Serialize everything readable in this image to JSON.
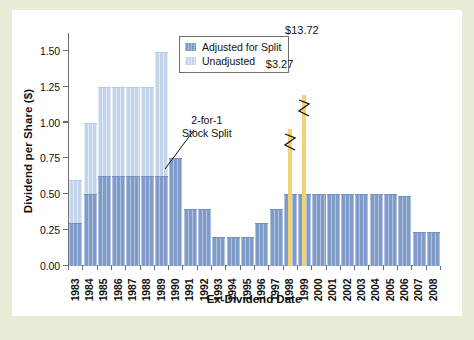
{
  "figure": {
    "background_color": "#e6ecd5",
    "card_color": "#ffffff"
  },
  "chart_data": {
    "type": "bar",
    "title": "",
    "xlabel": "Ex-Dividend Date",
    "ylabel": "Dividend per Share ($)",
    "ylim": [
      0.0,
      1.625
    ],
    "ytick_labels": [
      "0.00",
      "0.25",
      "0.50",
      "0.75",
      "1.00",
      "1.25",
      "1.50"
    ],
    "ytick_values": [
      0.0,
      0.25,
      0.5,
      0.75,
      1.0,
      1.25,
      1.5
    ],
    "grid": false,
    "legend_position": "upper center",
    "categories": [
      "1983",
      "1984",
      "1985",
      "1986",
      "1987",
      "1988",
      "1989",
      "1990",
      "1991",
      "1992",
      "1993",
      "1994",
      "1995",
      "1996",
      "1997",
      "1998",
      "1999",
      "2000",
      "2001",
      "2002",
      "2003",
      "2004",
      "2005",
      "2006",
      "2007",
      "2008"
    ],
    "series": [
      {
        "name": "Unadjusted",
        "color": "#c3d5ea",
        "values": [
          0.6,
          1.0,
          1.25,
          1.25,
          1.25,
          1.25,
          1.49,
          null,
          null,
          null,
          null,
          null,
          null,
          null,
          null,
          null,
          null,
          null,
          null,
          null,
          null,
          null,
          null,
          null,
          null,
          null
        ]
      },
      {
        "name": "Adjusted for Split",
        "color": "#7e9bc9",
        "values": [
          0.3,
          0.5,
          0.625,
          0.625,
          0.625,
          0.625,
          0.625,
          0.75,
          0.4,
          0.4,
          0.2,
          0.2,
          0.2,
          0.3,
          0.4,
          0.5,
          0.5,
          0.5,
          0.5,
          0.5,
          0.5,
          0.5,
          0.5,
          0.49,
          0.235,
          0.235
        ]
      }
    ],
    "special_dividends": [
      {
        "label": "$3.27",
        "year": "1998",
        "color": "#f3d273",
        "truncated": true
      },
      {
        "label": "$13.72",
        "year": "1999",
        "color": "#f3d273",
        "truncated": true
      }
    ],
    "annotations": [
      {
        "name": "stock-split",
        "line1": "2-for-1",
        "line2": "Stock Split",
        "points_to_year": "1990"
      }
    ]
  },
  "legend": {
    "entries": [
      {
        "label": "Adjusted for Split",
        "swatch": "adj"
      },
      {
        "label": "Unadjusted",
        "swatch": "unadj"
      }
    ]
  }
}
